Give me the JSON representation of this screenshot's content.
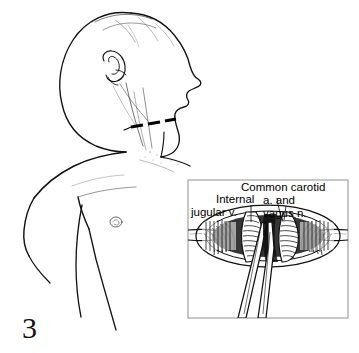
{
  "figure": {
    "number": "3",
    "background_color": "#ffffff",
    "ink_color": "#000000",
    "caption_font_color": "#111111"
  },
  "patient_illustration": {
    "subject": "infant head turned to side with neck and upper torso exposed",
    "view": "three-quarter anterolateral",
    "features": [
      "head",
      "ear",
      "chin",
      "nose",
      "neck",
      "shoulder",
      "arm",
      "chest",
      "nipple",
      "axilla"
    ],
    "incision_marking": {
      "name": "dashed incision line",
      "style": "dashed",
      "dash_count": 3,
      "location": "right lateral neck above clavicle",
      "color": "#000000"
    }
  },
  "inset": {
    "title": "operative field detail",
    "border_color": "#9a9a9a",
    "contents": "retracted neck wound exposing great vessels with a hemostat in the field",
    "labels": [
      {
        "id": "common_carotid",
        "text": "Common carotid"
      },
      {
        "id": "a_and",
        "text": "a. and"
      },
      {
        "id": "vagus_n",
        "text": "vagus n."
      },
      {
        "id": "internal",
        "text": "Internal"
      },
      {
        "id": "jugular_v",
        "text": "jugular v."
      }
    ],
    "structures": [
      "internal jugular vein",
      "common carotid artery",
      "vagus nerve",
      "retracted wound edges",
      "surgical forceps"
    ]
  }
}
